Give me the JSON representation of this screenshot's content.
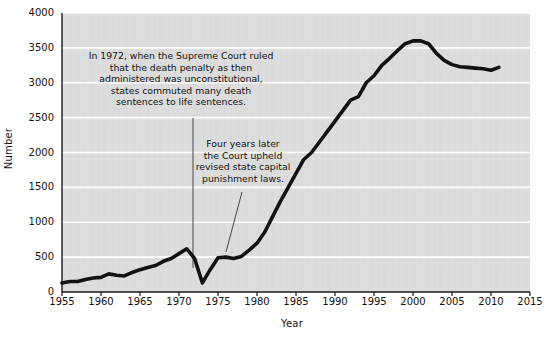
{
  "chart_data": {
    "type": "line",
    "title": "",
    "xlabel": "Year",
    "ylabel": "Number",
    "xlim": [
      1955,
      2015
    ],
    "ylim": [
      0,
      4000
    ],
    "xticks": [
      1955,
      1960,
      1965,
      1970,
      1975,
      1980,
      1985,
      1990,
      1995,
      2000,
      2005,
      2010,
      2015
    ],
    "yticks": [
      0,
      500,
      1000,
      1500,
      2000,
      2500,
      3000,
      3500,
      4000
    ],
    "grid": "horizontal",
    "legend": null,
    "line_color": "#111111",
    "plot_background": "#dcdcdc",
    "gridline_color": "#ffffff",
    "series": [
      {
        "name": "Number under sentence of death",
        "x": [
          1955,
          1956,
          1957,
          1958,
          1959,
          1960,
          1961,
          1962,
          1963,
          1964,
          1965,
          1966,
          1967,
          1968,
          1969,
          1970,
          1971,
          1972,
          1973,
          1974,
          1975,
          1976,
          1977,
          1978,
          1979,
          1980,
          1981,
          1982,
          1983,
          1984,
          1985,
          1986,
          1987,
          1988,
          1989,
          1990,
          1991,
          1992,
          1993,
          1994,
          1995,
          1996,
          1997,
          1998,
          1999,
          2000,
          2001,
          2002,
          2003,
          2004,
          2005,
          2006,
          2007,
          2008,
          2009,
          2010,
          2011
        ],
        "y": [
          130,
          150,
          150,
          180,
          200,
          210,
          260,
          240,
          230,
          280,
          320,
          350,
          380,
          440,
          480,
          550,
          620,
          480,
          130,
          320,
          490,
          500,
          480,
          510,
          600,
          700,
          860,
          1080,
          1300,
          1500,
          1700,
          1900,
          2000,
          2150,
          2300,
          2450,
          2600,
          2750,
          2800,
          3000,
          3100,
          3250,
          3350,
          3460,
          3560,
          3600,
          3600,
          3560,
          3420,
          3320,
          3260,
          3230,
          3220,
          3210,
          3200,
          3180,
          3220
        ]
      }
    ],
    "annotations": [
      {
        "name": "annotation-1972",
        "text": "In 1972, when the Supreme Court ruled\nthat the death penalty as then\nadministered was unconstitutional,\nstates commuted many death\nsentences to life sentences.",
        "points_to_year": 1972
      },
      {
        "name": "annotation-1976",
        "text": "Four years later\nthe Court upheld\nrevised state capital\npunishment laws.",
        "points_to_year": 1976
      }
    ]
  },
  "footnote": ""
}
